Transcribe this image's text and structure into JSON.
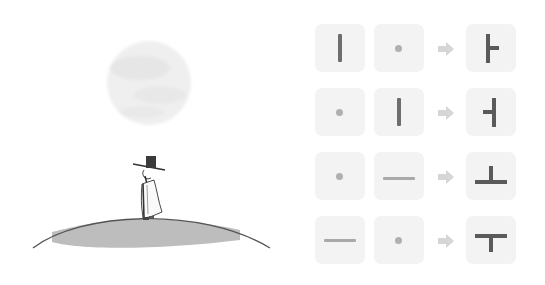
{
  "diagram": {
    "colors": {
      "tile_bg": "#f3f3f3",
      "stroke_input": "#6e6e6e",
      "stroke_light": "#a9a9a9",
      "dot": "#b0b0b0",
      "result_stroke": "#5a5a5a",
      "arrow": "#d6d6d6",
      "hill": "#bdbdbd",
      "moon": "#ececec"
    },
    "rows": [
      {
        "left": "vertical-bar",
        "right": "dot",
        "result": "ㅏ"
      },
      {
        "left": "dot",
        "right": "vertical-bar",
        "result": "ㅓ"
      },
      {
        "left": "dot",
        "right": "horizontal-bar",
        "result": "ㅗ"
      },
      {
        "left": "horizontal-bar",
        "right": "dot",
        "result": "ㅜ"
      }
    ]
  },
  "illustration": {
    "elements": [
      "moon",
      "man-in-gat-hat",
      "hill"
    ]
  }
}
